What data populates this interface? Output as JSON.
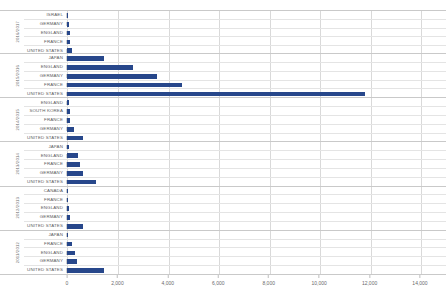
{
  "chart": {
    "type": "bar",
    "title": "",
    "xlabel": "",
    "ylabel": "",
    "orientation": "horizontal",
    "bar_color": "#27478b",
    "grid": true,
    "legend": "none"
  },
  "axis": {
    "xlim": [
      0,
      14000
    ],
    "ticks": [
      {
        "label": "0",
        "value": 0
      },
      {
        "label": "2,000",
        "value": 2000
      },
      {
        "label": "4,000",
        "value": 4000
      },
      {
        "label": "6,000",
        "value": 6000
      },
      {
        "label": "8,000",
        "value": 8000
      },
      {
        "label": "10,000",
        "value": 10000
      },
      {
        "label": "12,000",
        "value": 12000
      },
      {
        "label": "14,000",
        "value": 14000
      }
    ]
  },
  "chart_data": {
    "type": "bar",
    "orientation": "horizontal",
    "title": "",
    "xlabel": "",
    "ylabel": "",
    "xlim": [
      0,
      14000
    ],
    "grid": true,
    "legend": "none",
    "groups": [
      {
        "label": "2016/2017",
        "categories": [
          "ISRAEL",
          "GERMANY",
          "ENGLAND",
          "FRANCE",
          "UNITED STATES"
        ],
        "values": [
          20,
          60,
          110,
          120,
          180
        ]
      },
      {
        "label": "2015/2016",
        "categories": [
          "JAPAN",
          "ENGLAND",
          "GERMANY",
          "FRANCE",
          "UNITED STATES"
        ],
        "values": [
          1450,
          2600,
          3550,
          4550,
          11800
        ]
      },
      {
        "label": "2014/2015",
        "categories": [
          "ENGLAND",
          "SOUTH KOREA",
          "FRANCE",
          "GERMANY",
          "UNITED STATES"
        ],
        "values": [
          90,
          110,
          130,
          280,
          640
        ]
      },
      {
        "label": "2013/2014",
        "categories": [
          "JAPAN",
          "ENGLAND",
          "FRANCE",
          "GERMANY",
          "UNITED STATES"
        ],
        "values": [
          90,
          430,
          500,
          620,
          1150
        ]
      },
      {
        "label": "2012/2013",
        "categories": [
          "CANADA",
          "FRANCE",
          "ENGLAND",
          "GERMANY",
          "UNITED STATES"
        ],
        "values": [
          20,
          50,
          90,
          100,
          620
        ]
      },
      {
        "label": "2011/2012",
        "categories": [
          "JAPAN",
          "FRANCE",
          "ENGLAND",
          "GERMANY",
          "UNITED STATES"
        ],
        "values": [
          30,
          190,
          330,
          390,
          1450
        ]
      }
    ]
  }
}
